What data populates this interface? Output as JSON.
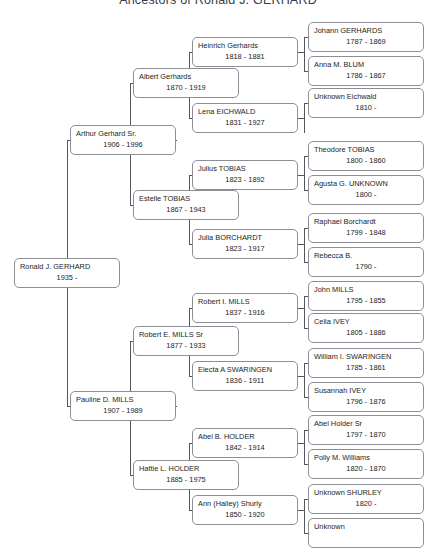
{
  "title": "Ancestors of Ronald J. GERHARD",
  "chart_data": {
    "type": "diagram",
    "diagram_kind": "ancestor-pedigree-tree",
    "generations": 5,
    "root": "Ronald J. GERHARD",
    "people": [
      {
        "id": "p1",
        "generation": 1,
        "name": "Ronald J. GERHARD",
        "dates": "1935 -",
        "birth": 1935,
        "death": null
      },
      {
        "id": "p2",
        "generation": 2,
        "name": "Arthur Gerhard Sr.",
        "dates": "1906 - 1996",
        "birth": 1906,
        "death": 1996
      },
      {
        "id": "p3",
        "generation": 2,
        "name": "Pauline D. MILLS",
        "dates": "1907 - 1989",
        "birth": 1907,
        "death": 1989
      },
      {
        "id": "p4",
        "generation": 3,
        "name": "Albert Gerhards",
        "dates": "1870 - 1919",
        "birth": 1870,
        "death": 1919
      },
      {
        "id": "p5",
        "generation": 3,
        "name": "Estelle TOBIAS",
        "dates": "1867 - 1943",
        "birth": 1867,
        "death": 1943
      },
      {
        "id": "p6",
        "generation": 3,
        "name": "Robert E. MILLS Sr",
        "dates": "1877 - 1933",
        "birth": 1877,
        "death": 1933
      },
      {
        "id": "p7",
        "generation": 3,
        "name": "Hattie L. HOLDER",
        "dates": "1885 - 1975",
        "birth": 1885,
        "death": 1975
      },
      {
        "id": "p8",
        "generation": 4,
        "name": "Heinrich Gerhards",
        "dates": "1818 - 1881",
        "birth": 1818,
        "death": 1881
      },
      {
        "id": "p9",
        "generation": 4,
        "name": "Lena EICHWALD",
        "dates": "1831 - 1927",
        "birth": 1831,
        "death": 1927
      },
      {
        "id": "p10",
        "generation": 4,
        "name": "Julius TOBIAS",
        "dates": "1823 - 1892",
        "birth": 1823,
        "death": 1892
      },
      {
        "id": "p11",
        "generation": 4,
        "name": "Julia BORCHARDT",
        "dates": "1823 - 1917",
        "birth": 1823,
        "death": 1917
      },
      {
        "id": "p12",
        "generation": 4,
        "name": "Robert I. MILLS",
        "dates": "1837 - 1916",
        "birth": 1837,
        "death": 1916
      },
      {
        "id": "p13",
        "generation": 4,
        "name": "Electa A  SWARINGEN",
        "dates": "1836 - 1911",
        "birth": 1836,
        "death": 1911
      },
      {
        "id": "p14",
        "generation": 4,
        "name": "Abel B. HOLDER",
        "dates": "1842 - 1914",
        "birth": 1842,
        "death": 1914
      },
      {
        "id": "p15",
        "generation": 4,
        "name": "Ann (Hailey) Shurly",
        "dates": "1850 - 1920",
        "birth": 1850,
        "death": 1920
      },
      {
        "id": "p16",
        "generation": 5,
        "name": "Johann GERHARDS",
        "dates": "1787 - 1869",
        "birth": 1787,
        "death": 1869
      },
      {
        "id": "p17",
        "generation": 5,
        "name": "Anna M. BLUM",
        "dates": "1786 - 1867",
        "birth": 1786,
        "death": 1867
      },
      {
        "id": "p18",
        "generation": 5,
        "name": "Unknown Eichwald",
        "dates": "1810 -",
        "birth": 1810,
        "death": null
      },
      {
        "id": "p19",
        "generation": 5,
        "name": "Theodore TOBIAS",
        "dates": "1800 - 1860",
        "birth": 1800,
        "death": 1860
      },
      {
        "id": "p20",
        "generation": 5,
        "name": "Agusta G. UNKNOWN",
        "dates": "1800 -",
        "birth": 1800,
        "death": null
      },
      {
        "id": "p21",
        "generation": 5,
        "name": "Raphael Borchardt",
        "dates": "1799 - 1848",
        "birth": 1799,
        "death": 1848
      },
      {
        "id": "p22",
        "generation": 5,
        "name": "Rebecca B.",
        "dates": "1790 -",
        "birth": 1790,
        "death": null
      },
      {
        "id": "p23",
        "generation": 5,
        "name": "John MILLS",
        "dates": "1795 - 1855",
        "birth": 1795,
        "death": 1855
      },
      {
        "id": "p24",
        "generation": 5,
        "name": "Celia IVEY",
        "dates": "1805 - 1886",
        "birth": 1805,
        "death": 1886
      },
      {
        "id": "p25",
        "generation": 5,
        "name": "William I. SWARINGEN",
        "dates": "1785 - 1861",
        "birth": 1785,
        "death": 1861
      },
      {
        "id": "p26",
        "generation": 5,
        "name": "Susannah IVEY",
        "dates": "1796 - 1876",
        "birth": 1796,
        "death": 1876
      },
      {
        "id": "p27",
        "generation": 5,
        "name": "Abel Holder Sr",
        "dates": "1797 - 1870",
        "birth": 1797,
        "death": 1870
      },
      {
        "id": "p28",
        "generation": 5,
        "name": "Polly M. Williams",
        "dates": "1820 - 1870",
        "birth": 1820,
        "death": 1870
      },
      {
        "id": "p29",
        "generation": 5,
        "name": "Unknown SHURLEY",
        "dates": "1820 -",
        "birth": 1820,
        "death": null
      },
      {
        "id": "p30",
        "generation": 5,
        "name": "Unknown",
        "dates": "",
        "birth": null,
        "death": null
      }
    ],
    "edges": [
      {
        "child": "p1",
        "parents": [
          "p2",
          "p3"
        ]
      },
      {
        "child": "p2",
        "parents": [
          "p4",
          "p5"
        ]
      },
      {
        "child": "p3",
        "parents": [
          "p6",
          "p7"
        ]
      },
      {
        "child": "p4",
        "parents": [
          "p8",
          "p9"
        ]
      },
      {
        "child": "p5",
        "parents": [
          "p10",
          "p11"
        ]
      },
      {
        "child": "p6",
        "parents": [
          "p12",
          "p13"
        ]
      },
      {
        "child": "p7",
        "parents": [
          "p14",
          "p15"
        ]
      },
      {
        "child": "p8",
        "parents": [
          "p16",
          "p17"
        ]
      },
      {
        "child": "p9",
        "parents": [
          "p18"
        ]
      },
      {
        "child": "p10",
        "parents": [
          "p19",
          "p20"
        ]
      },
      {
        "child": "p11",
        "parents": [
          "p21",
          "p22"
        ]
      },
      {
        "child": "p12",
        "parents": [
          "p23",
          "p24"
        ]
      },
      {
        "child": "p13",
        "parents": [
          "p25",
          "p26"
        ]
      },
      {
        "child": "p14",
        "parents": [
          "p27",
          "p28"
        ]
      },
      {
        "child": "p15",
        "parents": [
          "p29",
          "p30"
        ]
      }
    ]
  },
  "layout": {
    "boxes": [
      {
        "id": "p1",
        "x": 14,
        "y": 258,
        "w": 106,
        "h": 30
      },
      {
        "id": "p2",
        "x": 70,
        "y": 125,
        "w": 106,
        "h": 30
      },
      {
        "id": "p3",
        "x": 70,
        "y": 391,
        "w": 106,
        "h": 30
      },
      {
        "id": "p4",
        "x": 133,
        "y": 68,
        "w": 106,
        "h": 30
      },
      {
        "id": "p5",
        "x": 133,
        "y": 190,
        "w": 106,
        "h": 30
      },
      {
        "id": "p6",
        "x": 133,
        "y": 326,
        "w": 106,
        "h": 30
      },
      {
        "id": "p7",
        "x": 133,
        "y": 460,
        "w": 106,
        "h": 30
      },
      {
        "id": "p8",
        "x": 192,
        "y": 37,
        "w": 106,
        "h": 30
      },
      {
        "id": "p9",
        "x": 192,
        "y": 103,
        "w": 106,
        "h": 30
      },
      {
        "id": "p10",
        "x": 192,
        "y": 160,
        "w": 106,
        "h": 30
      },
      {
        "id": "p11",
        "x": 192,
        "y": 229,
        "w": 106,
        "h": 30
      },
      {
        "id": "p12",
        "x": 192,
        "y": 293,
        "w": 106,
        "h": 30
      },
      {
        "id": "p13",
        "x": 192,
        "y": 361,
        "w": 106,
        "h": 30
      },
      {
        "id": "p14",
        "x": 192,
        "y": 428,
        "w": 106,
        "h": 30
      },
      {
        "id": "p15",
        "x": 192,
        "y": 495,
        "w": 106,
        "h": 30
      },
      {
        "id": "p16",
        "x": 308,
        "y": 22,
        "w": 116,
        "h": 30
      },
      {
        "id": "p17",
        "x": 308,
        "y": 56,
        "w": 116,
        "h": 30
      },
      {
        "id": "p18",
        "x": 308,
        "y": 88,
        "w": 116,
        "h": 30
      },
      {
        "id": "p19",
        "x": 308,
        "y": 141,
        "w": 116,
        "h": 30
      },
      {
        "id": "p20",
        "x": 308,
        "y": 175,
        "w": 116,
        "h": 30
      },
      {
        "id": "p21",
        "x": 308,
        "y": 213,
        "w": 116,
        "h": 30
      },
      {
        "id": "p22",
        "x": 308,
        "y": 247,
        "w": 116,
        "h": 30
      },
      {
        "id": "p23",
        "x": 308,
        "y": 281,
        "w": 116,
        "h": 30
      },
      {
        "id": "p24",
        "x": 308,
        "y": 313,
        "w": 116,
        "h": 30
      },
      {
        "id": "p25",
        "x": 308,
        "y": 348,
        "w": 116,
        "h": 30
      },
      {
        "id": "p26",
        "x": 308,
        "y": 382,
        "w": 116,
        "h": 30
      },
      {
        "id": "p27",
        "x": 308,
        "y": 415,
        "w": 116,
        "h": 30
      },
      {
        "id": "p28",
        "x": 308,
        "y": 449,
        "w": 116,
        "h": 30
      },
      {
        "id": "p29",
        "x": 308,
        "y": 484,
        "w": 116,
        "h": 30
      },
      {
        "id": "p30",
        "x": 308,
        "y": 518,
        "w": 116,
        "h": 30
      }
    ],
    "connectors": [
      {
        "type": "v",
        "x": 67,
        "y": 140,
        "len": 133
      },
      {
        "type": "v",
        "x": 67,
        "y": 273,
        "len": 133
      },
      {
        "type": "h",
        "x": 67,
        "y": 140,
        "len": 4
      },
      {
        "type": "h",
        "x": 67,
        "y": 273,
        "len": 4
      },
      {
        "type": "h",
        "x": 67,
        "y": 406,
        "len": 4
      },
      {
        "type": "v",
        "x": 130,
        "y": 83,
        "len": 57
      },
      {
        "type": "v",
        "x": 130,
        "y": 140,
        "len": 65
      },
      {
        "type": "h",
        "x": 130,
        "y": 83,
        "len": 4
      },
      {
        "type": "h",
        "x": 130,
        "y": 140,
        "len": 47
      },
      {
        "type": "h",
        "x": 130,
        "y": 205,
        "len": 4
      },
      {
        "type": "v",
        "x": 130,
        "y": 341,
        "len": 65
      },
      {
        "type": "v",
        "x": 130,
        "y": 406,
        "len": 69
      },
      {
        "type": "h",
        "x": 130,
        "y": 341,
        "len": 4
      },
      {
        "type": "h",
        "x": 130,
        "y": 406,
        "len": 47
      },
      {
        "type": "h",
        "x": 130,
        "y": 475,
        "len": 4
      },
      {
        "type": "v",
        "x": 189,
        "y": 52,
        "len": 31
      },
      {
        "type": "v",
        "x": 189,
        "y": 83,
        "len": 35
      },
      {
        "type": "h",
        "x": 189,
        "y": 52,
        "len": 4
      },
      {
        "type": "h",
        "x": 189,
        "y": 83,
        "len": 47
      },
      {
        "type": "h",
        "x": 189,
        "y": 118,
        "len": 4
      },
      {
        "type": "v",
        "x": 189,
        "y": 175,
        "len": 30
      },
      {
        "type": "v",
        "x": 189,
        "y": 205,
        "len": 39
      },
      {
        "type": "h",
        "x": 189,
        "y": 175,
        "len": 4
      },
      {
        "type": "h",
        "x": 189,
        "y": 205,
        "len": 47
      },
      {
        "type": "h",
        "x": 189,
        "y": 244,
        "len": 4
      },
      {
        "type": "v",
        "x": 189,
        "y": 308,
        "len": 33
      },
      {
        "type": "v",
        "x": 189,
        "y": 341,
        "len": 35
      },
      {
        "type": "h",
        "x": 189,
        "y": 308,
        "len": 4
      },
      {
        "type": "h",
        "x": 189,
        "y": 341,
        "len": 47
      },
      {
        "type": "h",
        "x": 189,
        "y": 376,
        "len": 4
      },
      {
        "type": "v",
        "x": 189,
        "y": 443,
        "len": 32
      },
      {
        "type": "v",
        "x": 189,
        "y": 475,
        "len": 35
      },
      {
        "type": "h",
        "x": 189,
        "y": 443,
        "len": 4
      },
      {
        "type": "h",
        "x": 189,
        "y": 475,
        "len": 47
      },
      {
        "type": "h",
        "x": 189,
        "y": 510,
        "len": 4
      },
      {
        "type": "v",
        "x": 304,
        "y": 37,
        "len": 34
      },
      {
        "type": "h",
        "x": 298,
        "y": 52,
        "len": 7
      },
      {
        "type": "h",
        "x": 304,
        "y": 37,
        "len": 5
      },
      {
        "type": "h",
        "x": 304,
        "y": 71,
        "len": 5
      },
      {
        "type": "v",
        "x": 304,
        "y": 103,
        "len": 1
      },
      {
        "type": "h",
        "x": 298,
        "y": 118,
        "len": 7
      },
      {
        "type": "v",
        "x": 304,
        "y": 103,
        "len": 30
      },
      {
        "type": "h",
        "x": 304,
        "y": 103,
        "len": 5
      },
      {
        "type": "v",
        "x": 304,
        "y": 156,
        "len": 34
      },
      {
        "type": "h",
        "x": 298,
        "y": 175,
        "len": 7
      },
      {
        "type": "h",
        "x": 304,
        "y": 156,
        "len": 5
      },
      {
        "type": "h",
        "x": 304,
        "y": 190,
        "len": 5
      },
      {
        "type": "v",
        "x": 304,
        "y": 228,
        "len": 34
      },
      {
        "type": "h",
        "x": 298,
        "y": 244,
        "len": 7
      },
      {
        "type": "h",
        "x": 304,
        "y": 228,
        "len": 5
      },
      {
        "type": "h",
        "x": 304,
        "y": 262,
        "len": 5
      },
      {
        "type": "v",
        "x": 304,
        "y": 296,
        "len": 32
      },
      {
        "type": "h",
        "x": 298,
        "y": 308,
        "len": 7
      },
      {
        "type": "h",
        "x": 304,
        "y": 296,
        "len": 5
      },
      {
        "type": "h",
        "x": 304,
        "y": 328,
        "len": 5
      },
      {
        "type": "v",
        "x": 304,
        "y": 363,
        "len": 34
      },
      {
        "type": "h",
        "x": 298,
        "y": 376,
        "len": 7
      },
      {
        "type": "h",
        "x": 304,
        "y": 363,
        "len": 5
      },
      {
        "type": "h",
        "x": 304,
        "y": 397,
        "len": 5
      },
      {
        "type": "v",
        "x": 304,
        "y": 430,
        "len": 34
      },
      {
        "type": "h",
        "x": 298,
        "y": 443,
        "len": 7
      },
      {
        "type": "h",
        "x": 304,
        "y": 430,
        "len": 5
      },
      {
        "type": "h",
        "x": 304,
        "y": 464,
        "len": 5
      },
      {
        "type": "v",
        "x": 304,
        "y": 499,
        "len": 34
      },
      {
        "type": "h",
        "x": 298,
        "y": 510,
        "len": 7
      },
      {
        "type": "h",
        "x": 304,
        "y": 499,
        "len": 5
      },
      {
        "type": "h",
        "x": 304,
        "y": 533,
        "len": 5
      }
    ]
  }
}
